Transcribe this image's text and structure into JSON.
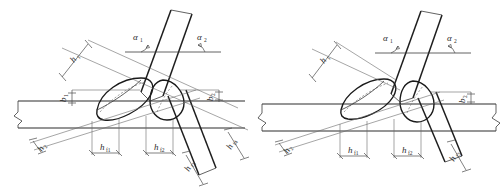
{
  "figure": {
    "background_color": "#ffffff",
    "line_color": "#2d2d2d",
    "dimension_color": "#4a4a4a"
  },
  "left_view": {
    "name": "left-joint-view",
    "angles": [
      {
        "id": "alpha-1",
        "symbol": "α",
        "subscript": "1"
      },
      {
        "id": "alpha-2",
        "symbol": "α",
        "subscript": "2"
      }
    ],
    "dimensions": [
      {
        "id": "h-upper-left",
        "symbol": "h",
        "subscript": "₁",
        "orientation": "rotated"
      },
      {
        "id": "b-left",
        "symbol": "b",
        "subscript": "₁",
        "orientation": "rotated"
      },
      {
        "id": "b-right",
        "symbol": "b",
        "subscript": "₂",
        "orientation": "rotated"
      },
      {
        "id": "h-bottom-first",
        "symbol": "h",
        "subscript": "f1",
        "orientation": "horizontal"
      },
      {
        "id": "h-bottom-second",
        "symbol": "h",
        "subscript": "f2",
        "orientation": "horizontal"
      },
      {
        "id": "h-lower-left",
        "symbol": "h",
        "subscript": "₂",
        "orientation": "rotated"
      },
      {
        "id": "h-lower-mid",
        "symbol": "h",
        "subscript": "f3",
        "orientation": "rotated"
      },
      {
        "id": "h-lower-right",
        "symbol": "h",
        "subscript": "f4",
        "orientation": "rotated"
      }
    ]
  },
  "right_view": {
    "name": "right-joint-view",
    "angles": [
      {
        "id": "alpha-1",
        "symbol": "α",
        "subscript": "1"
      },
      {
        "id": "alpha-2",
        "symbol": "α",
        "subscript": "2"
      }
    ],
    "dimensions": [
      {
        "id": "h-upper-left",
        "symbol": "h",
        "subscript": "₁",
        "orientation": "rotated"
      },
      {
        "id": "b-right",
        "symbol": "b",
        "subscript": "₂",
        "orientation": "rotated"
      },
      {
        "id": "h-bottom-first",
        "symbol": "h",
        "subscript": "f1",
        "orientation": "horizontal"
      },
      {
        "id": "h-bottom-second",
        "symbol": "h",
        "subscript": "f2",
        "orientation": "horizontal"
      },
      {
        "id": "h-lower-left",
        "symbol": "h",
        "subscript": "₂",
        "orientation": "rotated"
      },
      {
        "id": "h-lower-right",
        "symbol": "h",
        "subscript": "f3",
        "orientation": "rotated"
      }
    ]
  },
  "labels": {
    "alpha1": "α",
    "alpha1_sub": "1",
    "alpha2": "α",
    "alpha2_sub": "2",
    "h": "h",
    "b": "b",
    "sub_1": "1",
    "sub_2": "2",
    "sub_f1": "f1",
    "sub_f2": "f2",
    "sub_f3": "f3",
    "sub_f4": "f4"
  }
}
